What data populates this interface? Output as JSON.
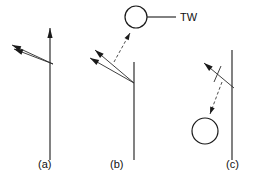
{
  "figure": {
    "width": 258,
    "height": 178,
    "background_color": "#ffffff",
    "ink_color": "#1a1a1a"
  },
  "annotations": {
    "tw_label": "TW",
    "tw_leader_line": "leader-line"
  },
  "panels": [
    {
      "id": "a",
      "label": "(a)",
      "label_x": 38,
      "label_y": 168,
      "vertical_line": {
        "x": 50,
        "y_top": 28,
        "y_bottom": 160,
        "has_arrowhead_top": true
      },
      "rays": [
        {
          "name": "incident-ray-upper",
          "x1": 53,
          "y1": 64,
          "x2": 12,
          "y2": 45
        },
        {
          "name": "incident-ray-lower",
          "x1": 53,
          "y1": 64,
          "x2": 14,
          "y2": 49
        }
      ],
      "circles": [],
      "dashed_arrows": [],
      "tick_marks": []
    },
    {
      "id": "b",
      "label": "(b)",
      "label_x": 110,
      "label_y": 168,
      "vertical_line": {
        "x": 134,
        "y_top": 62,
        "y_bottom": 160,
        "has_arrowhead_top": false
      },
      "rays": [
        {
          "name": "reflected-ray-upper",
          "x1": 134,
          "y1": 83,
          "x2": 95,
          "y2": 50
        },
        {
          "name": "reflected-ray-lower",
          "x1": 134,
          "y1": 83,
          "x2": 90,
          "y2": 58
        }
      ],
      "circles": [
        {
          "name": "tw-circle",
          "cx": 136,
          "cy": 17,
          "r": 11
        }
      ],
      "dashed_arrows": [
        {
          "name": "pointer-to-tw-circle",
          "x1": 114,
          "y1": 62,
          "x2": 130,
          "y2": 33
        }
      ],
      "tick_marks": []
    },
    {
      "id": "c",
      "label": "(c)",
      "label_x": 226,
      "label_y": 168,
      "vertical_line": {
        "x": 232,
        "y_top": 50,
        "y_bottom": 160,
        "has_arrowhead_top": false
      },
      "rays": [
        {
          "name": "outgoing-ray",
          "x1": 234,
          "y1": 88,
          "x2": 204,
          "y2": 63
        }
      ],
      "circles": [
        {
          "name": "lower-circle",
          "cx": 205,
          "cy": 131,
          "r": 13
        }
      ],
      "dashed_arrows": [
        {
          "name": "pointer-to-lower-circle",
          "x1": 222,
          "y1": 82,
          "x2": 210,
          "y2": 114
        }
      ],
      "tick_marks": [
        {
          "name": "ray-tick",
          "x1": 221,
          "y1": 66,
          "x2": 214,
          "y2": 82
        }
      ]
    }
  ]
}
